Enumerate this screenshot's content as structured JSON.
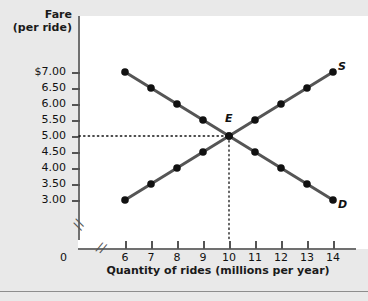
{
  "chart_data": {
    "type": "line",
    "title": "",
    "xlabel": "Quantity of rides (millions per year)",
    "ylabel": "Fare (per ride)",
    "grid": false,
    "legend_position": "curve-end-labels",
    "xlim": [
      6,
      14
    ],
    "ylim": [
      3.0,
      7.0
    ],
    "x": [
      6,
      7,
      8,
      9,
      10,
      11,
      12,
      13,
      14
    ],
    "xticklabels": [
      "6",
      "7",
      "8",
      "9",
      "10",
      "11",
      "12",
      "13",
      "14"
    ],
    "yticklabels": [
      "$7.00",
      "6.50",
      "6.00",
      "5.50",
      "5.00",
      "4.50",
      "4.00",
      "3.50",
      "3.00"
    ],
    "yticks": [
      7.0,
      6.5,
      6.0,
      5.5,
      5.0,
      4.5,
      4.0,
      3.5,
      3.0
    ],
    "origin_label": "0",
    "axis_break": "//",
    "series": [
      {
        "name": "D",
        "label": "D",
        "description": "Demand",
        "color": "#555555",
        "x": [
          6,
          7,
          8,
          9,
          10,
          11,
          12,
          13,
          14
        ],
        "values": [
          7.0,
          6.5,
          6.0,
          5.5,
          5.0,
          4.5,
          4.0,
          3.5,
          3.0
        ]
      },
      {
        "name": "S",
        "label": "S",
        "description": "Supply",
        "color": "#555555",
        "x": [
          6,
          7,
          8,
          9,
          10,
          11,
          12,
          13,
          14
        ],
        "values": [
          3.0,
          3.5,
          4.0,
          4.5,
          5.0,
          5.5,
          6.0,
          6.5,
          7.0
        ]
      }
    ],
    "annotations": [
      {
        "name": "E",
        "label": "E",
        "description": "Equilibrium",
        "x": 10,
        "y": 5.0,
        "guide_price": "5.00",
        "guide_quantity": "10"
      }
    ]
  },
  "axes": {
    "y_title_line1": "Fare",
    "y_title_line2": "(per ride)",
    "x_title": "Quantity of rides (millions per year)",
    "origin": "0",
    "break_mark": "//"
  },
  "ylabels": [
    "$7.00",
    "6.50",
    "6.00",
    "5.50",
    "5.00",
    "4.50",
    "4.00",
    "3.50",
    "3.00"
  ],
  "xlabels": [
    "6",
    "7",
    "8",
    "9",
    "10",
    "11",
    "12",
    "13",
    "14"
  ],
  "labels": {
    "supply": "S",
    "demand": "D",
    "equilibrium": "E"
  },
  "colors": {
    "background": "#e9e9e9",
    "panel": "#ffffff",
    "curve": "#555555",
    "point": "#111111",
    "axis": "#707070",
    "text": "#111111"
  }
}
